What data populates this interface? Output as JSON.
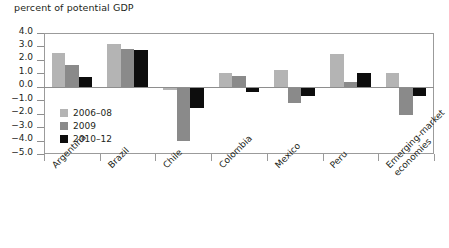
{
  "chart_data": {
    "type": "bar",
    "title": "percent of potential GDP",
    "xlabel": "",
    "ylabel": "",
    "ylim": [
      -5.0,
      4.0
    ],
    "yticks": [
      4.0,
      3.0,
      2.0,
      1.0,
      0.0,
      -1.0,
      -2.0,
      -3.0,
      -4.0,
      -5.0
    ],
    "ytick_labels": [
      "4.0",
      "3.0",
      "2.0",
      "1.0",
      "0.0",
      "-1.0",
      "-2.0",
      "-3.0",
      "-4.0",
      "-5.0"
    ],
    "grid": false,
    "legend_position": "inside lower-left",
    "categories": [
      "Argentina",
      "Brazil",
      "Chile",
      "Colombia",
      "Mexico",
      "Peru",
      "Emerging-market\neconomies"
    ],
    "series": [
      {
        "name": "2006–08",
        "color": "#b4b4b4",
        "values": [
          2.55,
          3.2,
          -0.25,
          1.0,
          1.25,
          2.45,
          1.0
        ]
      },
      {
        "name": "2009",
        "color": "#8a8a8a",
        "values": [
          1.6,
          2.8,
          -4.0,
          0.8,
          -1.2,
          0.35,
          -2.1
        ]
      },
      {
        "name": "2010–12",
        "color": "#0d0d0d",
        "values": [
          0.7,
          2.75,
          -1.6,
          -0.4,
          -0.65,
          1.05,
          -0.65
        ]
      }
    ]
  },
  "colors": {
    "series_2006_08": "#b4b4b4",
    "series_2009": "#8a8a8a",
    "series_2010_12": "#0d0d0d",
    "axis": "#8e8e8e",
    "frame": "#9b9b9b",
    "text": "#231f20"
  }
}
